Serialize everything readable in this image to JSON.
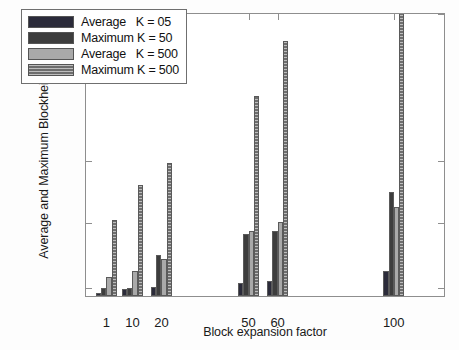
{
  "chart_data": {
    "type": "bar",
    "title": "",
    "xlabel": "Block expansion factor",
    "ylabel": "Average and Maximum Blockheight",
    "categories": [
      "1",
      "10",
      "20",
      "50",
      "60",
      "100"
    ],
    "category_positions": [
      1,
      10,
      20,
      50,
      60,
      100
    ],
    "xlim": [
      -6,
      118
    ],
    "ylim": [
      0,
      2000
    ],
    "y_ticks": [
      0,
      100,
      500,
      1000,
      2000
    ],
    "y_tick_labels": [
      "0",
      "100",
      "500",
      "1000",
      "2000"
    ],
    "y_scale": "piecewise-nonlinear",
    "grid": false,
    "legend_position": "upper-left",
    "series": [
      {
        "name": "Average   K = 05",
        "color": "#2b2b3a",
        "values": [
          35,
          75,
          95,
          120,
          130,
          190
        ]
      },
      {
        "name": "Maximum K = 50",
        "color": "#3d3d3d",
        "values": [
          85,
          78,
          290,
          420,
          440,
          735
        ]
      },
      {
        "name": "Average   K = 500",
        "color": "#a9a9a9",
        "values": [
          155,
          195,
          265,
          440,
          495,
          615
        ]
      },
      {
        "name": "Maximum K = 500",
        "color": "#6e6e6e",
        "values": [
          510,
          790,
          965,
          1430,
          1800,
          2000
        ]
      }
    ]
  },
  "legend": {
    "entries": [
      {
        "label": "Average   K = 05",
        "swatch": "series-0-swatch"
      },
      {
        "label": "Maximum K = 50",
        "swatch": "series-1-swatch"
      },
      {
        "label": "Average   K = 500",
        "swatch": "series-2-swatch"
      },
      {
        "label": "Maximum K = 500",
        "swatch": "series-3-swatch"
      }
    ]
  },
  "axes": {
    "y_title": "Average and Maximum Blockheight",
    "x_title": "Block expansion factor"
  }
}
